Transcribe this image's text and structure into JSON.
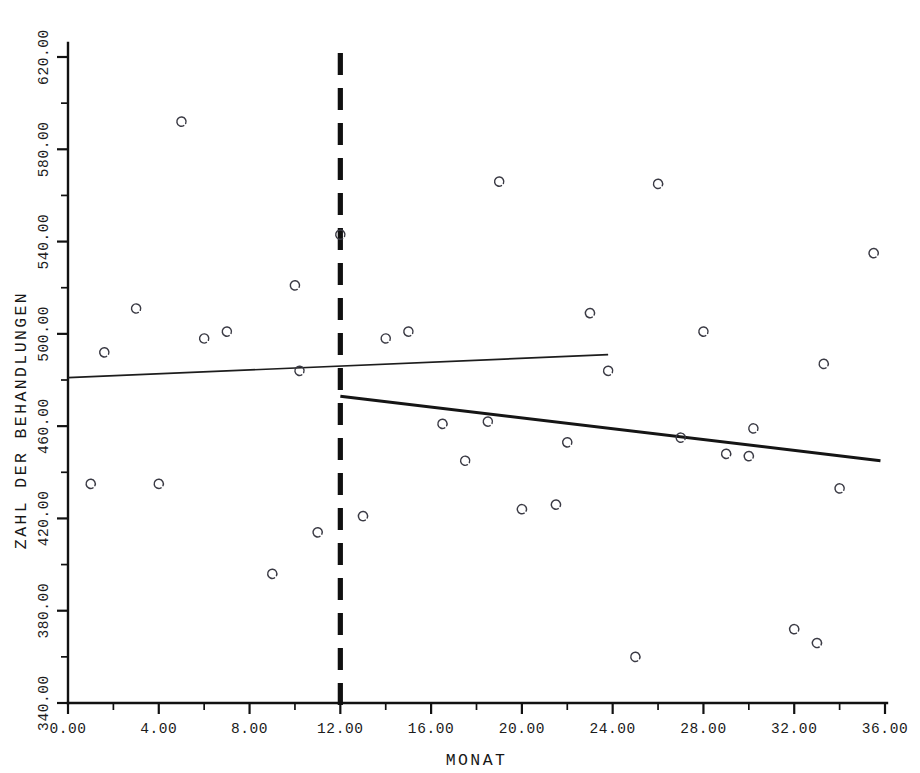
{
  "chart_data": {
    "type": "scatter",
    "title": "",
    "xlabel": "MONAT",
    "ylabel": "ZAHL DER BEHANDLUNGEN",
    "xlim": [
      0,
      36
    ],
    "ylim": [
      340,
      620
    ],
    "grid": false,
    "legend": null,
    "x_ticks": [
      "0.00",
      "4.00",
      "8.00",
      "12.00",
      "16.00",
      "20.00",
      "24.00",
      "28.00",
      "32.00",
      "36.00"
    ],
    "x_tick_values": [
      0,
      4,
      8,
      12,
      16,
      20,
      24,
      28,
      32,
      36
    ],
    "x_minor_step": 2,
    "y_ticks": [
      "340.00",
      "380.00",
      "420.00",
      "460.00",
      "500.00",
      "540.00",
      "580.00",
      "620.00"
    ],
    "y_tick_values": [
      340,
      380,
      420,
      460,
      500,
      540,
      580,
      620
    ],
    "y_minor_step": 20,
    "marker_style": "open-circle",
    "series": [
      {
        "name": "Behandlungen pro Monat",
        "points": [
          {
            "x": 1.0,
            "y": 435
          },
          {
            "x": 1.6,
            "y": 492
          },
          {
            "x": 3.0,
            "y": 511
          },
          {
            "x": 4.0,
            "y": 435
          },
          {
            "x": 5.0,
            "y": 592
          },
          {
            "x": 6.0,
            "y": 498
          },
          {
            "x": 7.0,
            "y": 501
          },
          {
            "x": 9.0,
            "y": 396
          },
          {
            "x": 10.0,
            "y": 521
          },
          {
            "x": 10.2,
            "y": 484
          },
          {
            "x": 11.0,
            "y": 414
          },
          {
            "x": 12.0,
            "y": 543
          },
          {
            "x": 13.0,
            "y": 421
          },
          {
            "x": 14.0,
            "y": 498
          },
          {
            "x": 15.0,
            "y": 501
          },
          {
            "x": 16.5,
            "y": 461
          },
          {
            "x": 17.5,
            "y": 445
          },
          {
            "x": 18.5,
            "y": 462
          },
          {
            "x": 19.0,
            "y": 566
          },
          {
            "x": 20.0,
            "y": 424
          },
          {
            "x": 21.5,
            "y": 426
          },
          {
            "x": 22.0,
            "y": 453
          },
          {
            "x": 23.0,
            "y": 509
          },
          {
            "x": 23.8,
            "y": 484
          },
          {
            "x": 25.0,
            "y": 360
          },
          {
            "x": 26.0,
            "y": 565
          },
          {
            "x": 27.0,
            "y": 455
          },
          {
            "x": 28.0,
            "y": 501
          },
          {
            "x": 29.0,
            "y": 448
          },
          {
            "x": 30.0,
            "y": 447
          },
          {
            "x": 30.2,
            "y": 459
          },
          {
            "x": 32.0,
            "y": 372
          },
          {
            "x": 33.0,
            "y": 366
          },
          {
            "x": 33.3,
            "y": 487
          },
          {
            "x": 34.0,
            "y": 433
          },
          {
            "x": 35.5,
            "y": 535
          }
        ]
      }
    ],
    "trend_lines": [
      {
        "name": "regression-pre-intervention",
        "segment": "pre",
        "x_start": 0.0,
        "y_start": 481,
        "x_end": 23.8,
        "y_end": 491,
        "weight": "thin"
      },
      {
        "name": "regression-post-intervention",
        "segment": "post",
        "x_start": 12.0,
        "y_start": 473,
        "x_end": 35.8,
        "y_end": 445,
        "weight": "thick"
      }
    ],
    "annotations": [
      {
        "name": "intervention-line",
        "type": "vertical-dashed-line",
        "x": 12.0,
        "y_from": 340,
        "y_to": 620,
        "style": "dashed"
      }
    ],
    "colors": {
      "axis": "#111111",
      "marker": "#3a3a44",
      "trend": "#151515",
      "intervention": "#101010",
      "background": "#ffffff"
    }
  }
}
